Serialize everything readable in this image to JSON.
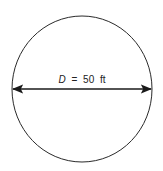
{
  "diagram": {
    "shape": "circle",
    "dimension": {
      "variable": "D",
      "equals": "=",
      "value": "50",
      "unit": "ft"
    },
    "colors": {
      "stroke": "#2a2a2a",
      "text": "#222222",
      "background": "#ffffff"
    }
  }
}
